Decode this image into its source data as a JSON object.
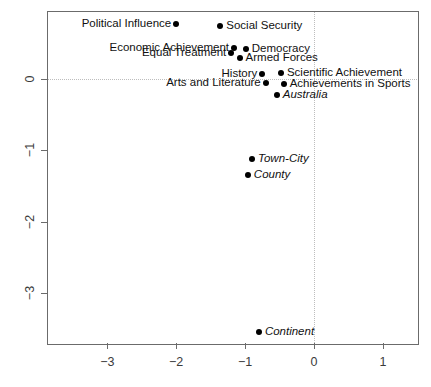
{
  "chart_data": {
    "type": "scatter",
    "title": "",
    "xlabel": "",
    "ylabel": "",
    "xlim": [
      -3.88,
      1.5
    ],
    "ylim": [
      -3.7,
      0.96
    ],
    "grid": false,
    "legend": null,
    "reference_lines": {
      "vertical_x": 0,
      "horizontal_y": 0,
      "style": "dotted"
    },
    "xticks": [
      -3,
      -2,
      -1,
      0,
      1
    ],
    "xtick_labels": [
      "−3",
      "−2",
      "−1",
      "0",
      "1"
    ],
    "yticks": [
      0,
      -1,
      -2,
      -3
    ],
    "ytick_labels": [
      "0",
      "−1",
      "−2",
      "−3"
    ],
    "points": [
      {
        "label": "Political Influence",
        "x": -2.0,
        "y": 0.77,
        "anchor": "left",
        "italic": false
      },
      {
        "label": "Social Security",
        "x": -1.36,
        "y": 0.74,
        "anchor": "right",
        "italic": false
      },
      {
        "label": "Economic Achievement",
        "x": -1.16,
        "y": 0.43,
        "anchor": "left",
        "italic": false
      },
      {
        "label": "Equal Treatment",
        "x": -1.2,
        "y": 0.36,
        "anchor": "left",
        "italic": false
      },
      {
        "label": "Democracy",
        "x": -0.99,
        "y": 0.42,
        "anchor": "right",
        "italic": false
      },
      {
        "label": "Armed Forces",
        "x": -1.08,
        "y": 0.29,
        "anchor": "right",
        "italic": false
      },
      {
        "label": "History",
        "x": -0.75,
        "y": 0.07,
        "anchor": "left",
        "italic": false
      },
      {
        "label": "Scientific Achievement",
        "x": -0.48,
        "y": 0.08,
        "anchor": "right",
        "italic": false
      },
      {
        "label": "Arts and Literature",
        "x": -0.7,
        "y": -0.06,
        "anchor": "left",
        "italic": false
      },
      {
        "label": "Achievements in Sports",
        "x": -0.44,
        "y": -0.07,
        "anchor": "right",
        "italic": false
      },
      {
        "label": "Australia",
        "x": -0.54,
        "y": -0.22,
        "anchor": "right",
        "italic": true
      },
      {
        "label": "Town-City",
        "x": -0.9,
        "y": -1.12,
        "anchor": "right",
        "italic": true
      },
      {
        "label": "County",
        "x": -0.96,
        "y": -1.35,
        "anchor": "right",
        "italic": true
      },
      {
        "label": "Continent",
        "x": -0.8,
        "y": -3.55,
        "anchor": "right",
        "italic": true
      }
    ]
  },
  "colors": {
    "point": "#000000",
    "frame": "#6b6b6b",
    "reference_line": "#bdbdbd",
    "tick_label": "#3b3b3b",
    "background": "#ffffff"
  },
  "geometry": {
    "frame": {
      "left": 47,
      "top": 11,
      "right": 417,
      "bottom": 343
    },
    "origin_px": {
      "x": 314,
      "y": 79
    },
    "scale_px_per_unit": {
      "x": 68.9,
      "y": 71.3
    },
    "tick_len": 6,
    "point_radius": 3
  }
}
